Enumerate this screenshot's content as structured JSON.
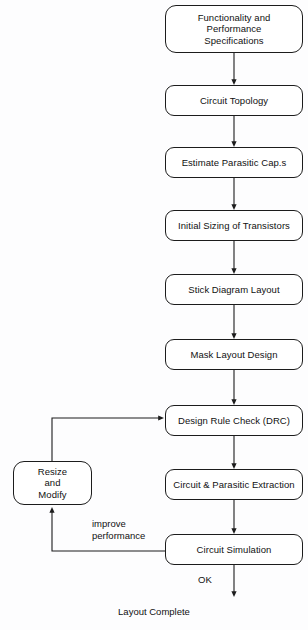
{
  "diagram": {
    "background_color": "#fdfdfe",
    "stroke_color": "#1c1c1c",
    "text_color": "#111111"
  },
  "nodes": [
    {
      "id": "spec",
      "label": "Functionality and\nPerformance\nSpecifications",
      "x": 165,
      "y": 5,
      "w": 138,
      "h": 48
    },
    {
      "id": "topology",
      "label": "Circuit Topology",
      "x": 165,
      "y": 85,
      "w": 138,
      "h": 31
    },
    {
      "id": "parasitic",
      "label": "Estimate Parasitic Cap.s",
      "x": 165,
      "y": 147,
      "w": 138,
      "h": 31
    },
    {
      "id": "sizing",
      "label": "Initial Sizing of Transistors",
      "x": 165,
      "y": 210,
      "w": 138,
      "h": 31
    },
    {
      "id": "stick",
      "label": "Stick Diagram Layout",
      "x": 165,
      "y": 274,
      "w": 138,
      "h": 31
    },
    {
      "id": "mask",
      "label": "Mask Layout Design",
      "x": 165,
      "y": 339,
      "w": 138,
      "h": 31
    },
    {
      "id": "drc",
      "label": "Design Rule Check (DRC)",
      "x": 165,
      "y": 405,
      "w": 138,
      "h": 31
    },
    {
      "id": "extraction",
      "label": "Circuit & Parasitic Extraction",
      "x": 165,
      "y": 469,
      "w": 138,
      "h": 31
    },
    {
      "id": "simulation",
      "label": "Circuit Simulation",
      "x": 165,
      "y": 534,
      "w": 138,
      "h": 31
    },
    {
      "id": "resize",
      "label": "Resize\nand\nModify",
      "x": 13,
      "y": 461,
      "w": 79,
      "h": 44
    }
  ],
  "edge_labels": [
    {
      "id": "improve",
      "text": "improve\nperformance",
      "x": 92,
      "y": 518
    },
    {
      "id": "ok",
      "text": "OK",
      "x": 198,
      "y": 574
    }
  ],
  "terminal": {
    "label": "Layout Complete",
    "y": 606
  },
  "connectors": [
    {
      "id": "spec-to-topology",
      "from": "spec",
      "to": "topology",
      "type": "vertical-arrow"
    },
    {
      "id": "topology-to-parasitic",
      "from": "topology",
      "to": "parasitic",
      "type": "vertical-arrow"
    },
    {
      "id": "parasitic-to-sizing",
      "from": "parasitic",
      "to": "sizing",
      "type": "vertical-arrow"
    },
    {
      "id": "sizing-to-stick",
      "from": "sizing",
      "to": "stick",
      "type": "vertical-arrow"
    },
    {
      "id": "stick-to-mask",
      "from": "stick",
      "to": "mask",
      "type": "vertical-arrow"
    },
    {
      "id": "mask-to-drc",
      "from": "mask",
      "to": "drc",
      "type": "vertical-arrow"
    },
    {
      "id": "drc-to-extraction",
      "from": "drc",
      "to": "extraction",
      "type": "vertical-arrow"
    },
    {
      "id": "extraction-to-simulation",
      "from": "extraction",
      "to": "simulation",
      "type": "vertical-arrow"
    },
    {
      "id": "simulation-to-complete",
      "from": "simulation",
      "to": "terminal",
      "type": "vertical-arrow"
    },
    {
      "id": "simulation-to-resize",
      "from": "simulation",
      "to": "resize",
      "type": "feedback-loop-lower"
    },
    {
      "id": "resize-to-drc",
      "from": "resize",
      "to": "drc",
      "type": "feedback-loop-upper"
    }
  ]
}
